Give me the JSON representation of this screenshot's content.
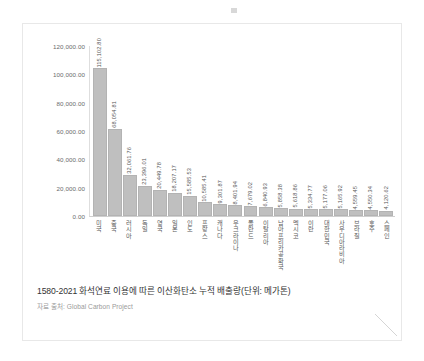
{
  "chart_data": {
    "type": "bar",
    "title": "1580-2021 화석연료 이용에 따른 이산화탄소 누적 배출량(단위: 메가톤)",
    "source": "자료 출처: Global Carbon Project",
    "xlabel": "",
    "ylabel": "",
    "ylim": [
      0,
      120000
    ],
    "grid": false,
    "legend": "none",
    "bar_color": "#bfbfbf",
    "y_ticks": [
      "120,000.00",
      "100,000.00",
      "80,000.00",
      "60,000.00",
      "40,000.00",
      "20,000.00",
      "0.00"
    ],
    "y_tick_values": [
      120000,
      100000,
      80000,
      60000,
      40000,
      20000,
      0
    ],
    "categories": [
      "미국",
      "중국",
      "러시아",
      "독일",
      "영국",
      "일본",
      "인도",
      "프랑스",
      "캐나다",
      "우크라이나",
      "폴란드",
      "이탈리아",
      "남아프리카공화국",
      "멕시코",
      "이란",
      "대한민국",
      "사우디아라비아",
      "브라질",
      "호주",
      "스페인"
    ],
    "values": [
      115102.8,
      68054.81,
      32061.76,
      23396.01,
      20449.78,
      18207.17,
      15585.53,
      10585.41,
      9301.87,
      8401.94,
      7679.02,
      6840.93,
      5858.38,
      5618.86,
      5334.77,
      5177.06,
      5165.92,
      4559.45,
      4550.34,
      4120.62
    ],
    "value_labels": [
      "115,102.80",
      "68,054.81",
      "32,061.76",
      "23,396.01",
      "20,449.78",
      "18,207.17",
      "15,585.53",
      "10,585.41",
      "9,301.87",
      "8,401.94",
      "7,679.02",
      "6,840.93",
      "5,858.38",
      "5,618.86",
      "5,334.77",
      "5,177.06",
      "5,165.92",
      "4,559.45",
      "4,550.34",
      "4,120.62"
    ]
  }
}
